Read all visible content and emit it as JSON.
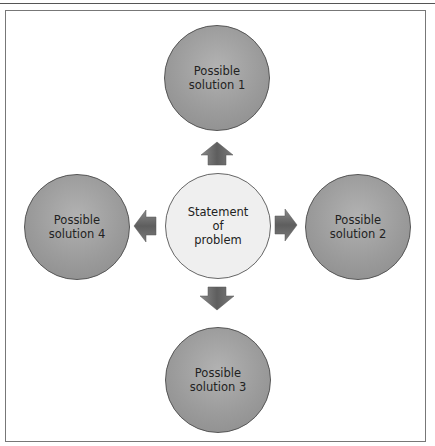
{
  "diagram": {
    "center": {
      "label": "Statement\nof\nproblem"
    },
    "solutions": [
      {
        "label": "Possible\nsolution 1",
        "position": "top"
      },
      {
        "label": "Possible\nsolution 2",
        "position": "right"
      },
      {
        "label": "Possible\nsolution 3",
        "position": "bottom"
      },
      {
        "label": "Possible\nsolution 4",
        "position": "left"
      }
    ],
    "colors": {
      "solution_fill": "#9b9b9b",
      "center_fill": "#efefef",
      "arrow_fill": "#6e6e6e",
      "frame": "#777777"
    }
  }
}
